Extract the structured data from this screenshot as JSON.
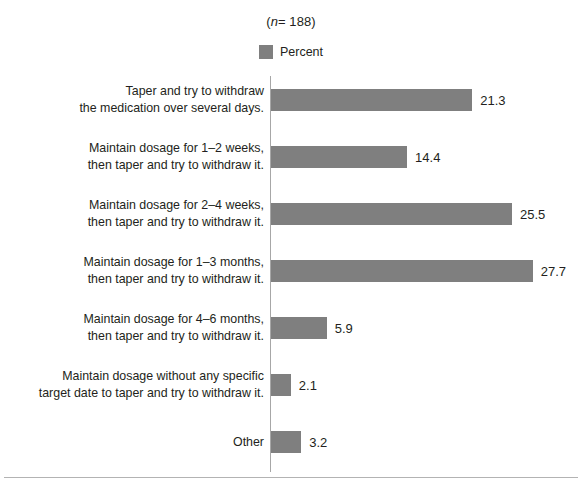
{
  "figure": {
    "title_prefix": "(",
    "title_italic": "n",
    "title_rest": "= 188)",
    "title_full": "(n= 188)",
    "bar_color": "#7f7f7f",
    "axis_color": "#a7a7a7",
    "text_color": "#231f20"
  },
  "legend": {
    "position": "top-center",
    "entries": [
      {
        "label": "Percent",
        "color": "#7f7f7f",
        "swatch_name": "legend-swatch-percent"
      }
    ]
  },
  "chart_data": {
    "type": "bar",
    "orientation": "horizontal",
    "title": "(n= 188)",
    "xlabel": "",
    "ylabel": "",
    "grid": false,
    "legend": [
      "Percent"
    ],
    "legend_position": "top-center",
    "xlim": [
      0,
      30
    ],
    "value_format": "one-decimal",
    "categories": [
      "Taper and try to withdraw\nthe medication over several days.",
      "Maintain dosage for 1–2 weeks,\nthen taper and try to withdraw it.",
      "Maintain dosage for 2–4 weeks,\nthen taper and try to withdraw it.",
      "Maintain dosage for 1–3 months,\nthen taper and try to withdraw it.",
      "Maintain dosage for 4–6 months,\nthen taper and try to withdraw it.",
      "Maintain dosage without any specific\ntarget date to taper and try to withdraw it.",
      "Other"
    ],
    "values": [
      21.3,
      14.4,
      25.5,
      27.7,
      5.9,
      2.1,
      3.2
    ],
    "value_labels": [
      "21.3",
      "14.4",
      "25.5",
      "27.7",
      "5.9",
      "2.1",
      "3.2"
    ],
    "series": [
      {
        "name": "Percent",
        "values": [
          21.3,
          14.4,
          25.5,
          27.7,
          5.9,
          2.1,
          3.2
        ]
      }
    ]
  }
}
